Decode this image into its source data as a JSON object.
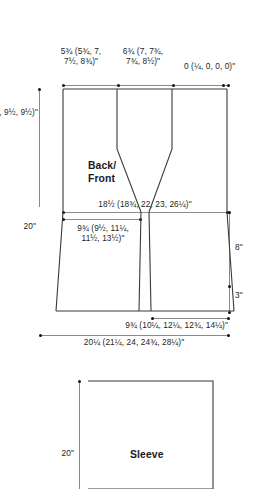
{
  "schematic": {
    "title": "Garment schematic",
    "pieces": [
      {
        "id": "back-front",
        "name": "Back/\nFront",
        "labels": {
          "shoulder_left": "5¾ (5¾, 7,\n7½, 8¾)\"",
          "neck_center": "6¾ (7, 7¾,\n7¾, 8½)\"",
          "shoulder_right": "0 (¼, 0, 0, 0)\"",
          "armhole_depth": "8 (8½, 9, 9½, 9½)\"",
          "total_length": "20\"",
          "chest_width": "18½ (18¾, 22, 23, 26¼)\"",
          "upper_body_depth": "9¾ (9½, 11¼,\n11½, 13½)\"",
          "side_seam": "8\"",
          "hem_band": "3\"",
          "lower_width": "9¾ (10¼, 12¼, 12¾, 14¼)\"",
          "hem_width": "20¼ (21¼, 24, 24¾, 28¼)\""
        }
      },
      {
        "id": "sleeve",
        "name": "Sleeve",
        "labels": {
          "length": "20\""
        }
      }
    ]
  },
  "colors": {
    "ink": "#231f20",
    "outline": "#3a3a3a",
    "dimension": "#8a8a8a",
    "background": "#ffffff"
  }
}
